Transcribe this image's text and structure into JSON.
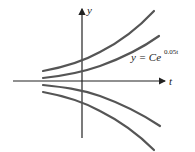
{
  "figure": {
    "y_axis_label": "y",
    "t_axis_label": "t",
    "equation": {
      "lhs": "y = Ce",
      "exponent": "0.05t"
    },
    "curves": [
      {
        "name": "curve-c-large-positive"
      },
      {
        "name": "curve-c-small-positive"
      },
      {
        "name": "curve-c-small-negative"
      },
      {
        "name": "curve-c-large-negative"
      }
    ],
    "colors": {
      "curve": "#555555",
      "axis": "#222222"
    }
  }
}
